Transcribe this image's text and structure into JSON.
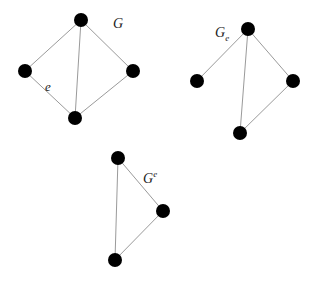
{
  "graphs": [
    {
      "id": "G",
      "label": {
        "base": "G",
        "sub": "",
        "sup": ""
      },
      "nodes": [
        "top",
        "left",
        "right",
        "bottom"
      ],
      "edges": [
        [
          "top",
          "left"
        ],
        [
          "top",
          "right"
        ],
        [
          "top",
          "bottom"
        ],
        [
          "left",
          "bottom"
        ],
        [
          "right",
          "bottom"
        ]
      ],
      "edge_labels": [
        {
          "edge": [
            "left",
            "bottom"
          ],
          "text": "e"
        }
      ]
    },
    {
      "id": "G_e",
      "label": {
        "base": "G",
        "sub": "e",
        "sup": ""
      },
      "nodes": [
        "top",
        "left",
        "right",
        "bottom"
      ],
      "edges": [
        [
          "top",
          "left"
        ],
        [
          "top",
          "right"
        ],
        [
          "top",
          "bottom"
        ],
        [
          "right",
          "bottom"
        ]
      ],
      "edge_labels": []
    },
    {
      "id": "G^e",
      "label": {
        "base": "G",
        "sub": "",
        "sup": "e"
      },
      "nodes": [
        "top",
        "right",
        "bottom"
      ],
      "edges": [
        [
          "top",
          "right"
        ],
        [
          "top",
          "bottom"
        ],
        [
          "right",
          "bottom"
        ]
      ],
      "edge_labels": []
    }
  ]
}
